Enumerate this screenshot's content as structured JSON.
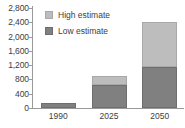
{
  "chart_data": {
    "type": "bar",
    "subtype": "stacked-bar",
    "title": "",
    "xlabel": "",
    "ylabel": "",
    "categories": [
      "1990",
      "2025",
      "2050"
    ],
    "series": [
      {
        "name": "Low estimate",
        "color": "#808080",
        "values": [
          150,
          640,
          1150
        ]
      },
      {
        "name": "High estimate",
        "color": "#bdbdbd",
        "values": [
          0,
          270,
          1250
        ]
      }
    ],
    "stack_totals": [
      150,
      910,
      2400
    ],
    "ylim": [
      0,
      2800
    ],
    "ytick_values": [
      0,
      400,
      800,
      1200,
      1600,
      2000,
      2400,
      2800
    ],
    "ytick_labels": [
      "0",
      "400",
      "800",
      "1,200",
      "1,600",
      "2,000",
      "2,400",
      "2,800"
    ],
    "grid": false,
    "legend_position": "top-left-inside",
    "legend_entries": [
      "High estimate",
      "Low estimate"
    ]
  },
  "legend": {
    "items": [
      {
        "label": "High estimate",
        "swatch": "legend-swatch-high"
      },
      {
        "label": "Low estimate",
        "swatch": "legend-swatch-low"
      }
    ]
  },
  "axes": {
    "y": {
      "ticks": [
        {
          "label": "2,800",
          "value": 2800
        },
        {
          "label": "2,400",
          "value": 2400
        },
        {
          "label": "2,000",
          "value": 2000
        },
        {
          "label": "1,600",
          "value": 1600
        },
        {
          "label": "1,200",
          "value": 1200
        },
        {
          "label": "800",
          "value": 800
        },
        {
          "label": "400",
          "value": 400
        },
        {
          "label": "0",
          "value": 0
        }
      ]
    },
    "x": {
      "labels": [
        "1990",
        "2025",
        "2050"
      ]
    }
  },
  "colors": {
    "low_estimate": "#808080",
    "high_estimate": "#bdbdbd",
    "axis": "#9a9a9a",
    "text": "#404040",
    "background": "#ffffff"
  }
}
